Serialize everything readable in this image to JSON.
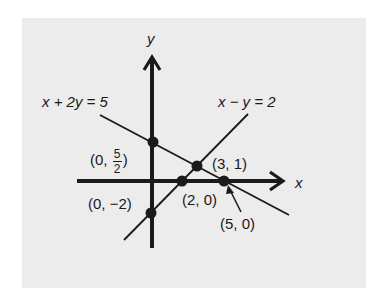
{
  "diagram": {
    "type": "system-of-linear-equations-graph",
    "axes": {
      "x_label": "x",
      "y_label": "y"
    },
    "lines": [
      {
        "equation": "x + 2y = 5",
        "label": "x + 2y = 5"
      },
      {
        "equation": "x - y = 2",
        "label": "x − y = 2"
      }
    ],
    "points": [
      {
        "name": "y-intercept-line1",
        "coords": [
          0,
          2.5
        ],
        "label_prefix": "(0,",
        "frac_num": "5",
        "frac_den": "2",
        "label_suffix": ")"
      },
      {
        "name": "intersection",
        "coords": [
          3,
          1
        ],
        "label": "(3, 1)"
      },
      {
        "name": "x-intercept-line2",
        "coords": [
          2,
          0
        ],
        "label": "(2, 0)"
      },
      {
        "name": "x-intercept-line1",
        "coords": [
          5,
          0
        ],
        "label": "(5, 0)"
      },
      {
        "name": "y-intercept-line2",
        "coords": [
          0,
          -2
        ],
        "label": "(0, −2)"
      }
    ],
    "colors": {
      "background": "#ffffff",
      "panel": "#ececec",
      "ink": "#1a1a1a"
    }
  }
}
